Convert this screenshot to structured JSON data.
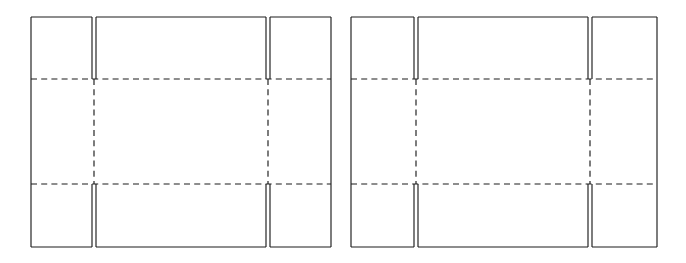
{
  "document": {
    "title": "Carton Dieline Blanks",
    "background_color": "#ffffff",
    "line_color": "#1c1c1c",
    "figure_count": 2,
    "figure_type": "packaging-dieline-drawing"
  },
  "legend": {
    "cut_line_label": "cut line (solid)",
    "crease_line_label": "crease / fold line (dashed)"
  },
  "figures": [
    {
      "id": "figure-left",
      "name": "left-carton-blank",
      "caption": "",
      "bounds": {
        "x": 31,
        "y": 17,
        "width": 300,
        "height": 231
      },
      "vertical_guides": [
        31,
        92,
        96,
        266,
        270,
        331
      ],
      "horizontal_guides": [
        17,
        79,
        184,
        247
      ],
      "slits": [
        {
          "name": "slit-top-left",
          "x": 94,
          "y_start": 17,
          "y_end": 79
        },
        {
          "name": "slit-top-right",
          "x": 268,
          "y_start": 17,
          "y_end": 79
        },
        {
          "name": "slit-bottom-left",
          "x": 94,
          "y_start": 184,
          "y_end": 247
        },
        {
          "name": "slit-bottom-right",
          "x": 268,
          "y_start": 184,
          "y_end": 247
        }
      ],
      "panels": [
        {
          "name": "top-left-flap",
          "row": "top",
          "col": "left"
        },
        {
          "name": "top-center-flap",
          "row": "top",
          "col": "center"
        },
        {
          "name": "top-right-flap",
          "row": "top",
          "col": "right"
        },
        {
          "name": "middle-left-panel",
          "row": "middle",
          "col": "left"
        },
        {
          "name": "middle-center-panel",
          "row": "middle",
          "col": "center"
        },
        {
          "name": "middle-right-panel",
          "row": "middle",
          "col": "right"
        },
        {
          "name": "bottom-left-flap",
          "row": "bottom",
          "col": "left"
        },
        {
          "name": "bottom-center-flap",
          "row": "bottom",
          "col": "center"
        },
        {
          "name": "bottom-right-flap",
          "row": "bottom",
          "col": "right"
        }
      ]
    },
    {
      "id": "figure-right",
      "name": "right-carton-blank",
      "caption": "",
      "bounds": {
        "x": 351,
        "y": 17,
        "width": 306,
        "height": 230
      },
      "vertical_guides": [
        351,
        414,
        418,
        588,
        592,
        657
      ],
      "horizontal_guides": [
        17,
        79,
        184,
        247
      ],
      "slits": [
        {
          "name": "slit-top-left",
          "x": 416,
          "y_start": 17,
          "y_end": 79
        },
        {
          "name": "slit-top-right",
          "x": 590,
          "y_start": 17,
          "y_end": 79
        },
        {
          "name": "slit-bottom-left",
          "x": 416,
          "y_start": 184,
          "y_end": 247
        },
        {
          "name": "slit-bottom-right",
          "x": 590,
          "y_start": 184,
          "y_end": 247
        }
      ],
      "panels": [
        {
          "name": "top-left-flap",
          "row": "top",
          "col": "left"
        },
        {
          "name": "top-center-flap",
          "row": "top",
          "col": "center"
        },
        {
          "name": "top-right-flap",
          "row": "top",
          "col": "right"
        },
        {
          "name": "middle-left-panel",
          "row": "middle",
          "col": "left"
        },
        {
          "name": "middle-center-panel",
          "row": "middle",
          "col": "center"
        },
        {
          "name": "middle-right-panel",
          "row": "middle",
          "col": "right"
        },
        {
          "name": "bottom-left-flap",
          "row": "bottom",
          "col": "left"
        },
        {
          "name": "bottom-center-flap",
          "row": "bottom",
          "col": "center"
        },
        {
          "name": "bottom-right-flap",
          "row": "bottom",
          "col": "right"
        }
      ]
    }
  ]
}
